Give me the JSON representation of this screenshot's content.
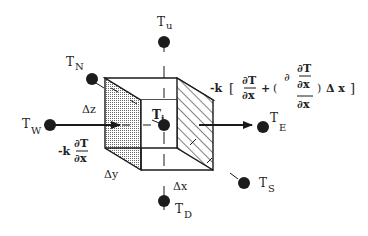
{
  "figure": {
    "type": "control-volume heat-conduction diagram",
    "nodes": {
      "center": {
        "label": "T",
        "subscript": "i"
      },
      "up": {
        "label": "T",
        "subscript": "u"
      },
      "down": {
        "label": "T",
        "subscript": "D"
      },
      "north": {
        "label": "T",
        "subscript": "N"
      },
      "south": {
        "label": "T",
        "subscript": "S"
      },
      "west": {
        "label": "T",
        "subscript": "W"
      },
      "east": {
        "label": "T",
        "subscript": "E"
      }
    },
    "dimensions": {
      "dz": "Δz",
      "dy": "Δy",
      "dx": "Δx"
    },
    "flux_in": {
      "prefix": "-k",
      "numerator": "∂T",
      "denominator": "∂x"
    },
    "flux_out": {
      "prefix": "-k",
      "open_bracket": "[",
      "term1_numerator": "∂T",
      "term1_denominator": "∂x",
      "plus": "+",
      "open_paren": "(",
      "partial": "∂",
      "inner_numerator": "∂T",
      "inner_denominator": "∂x",
      "outer_denominator": "∂x",
      "close_paren": ")",
      "delta": "Δ x",
      "close_bracket": "]"
    },
    "colors": {
      "ink": "#1a1a1a",
      "shaded_face": "#c8c8c8",
      "background": "#ffffff"
    }
  }
}
